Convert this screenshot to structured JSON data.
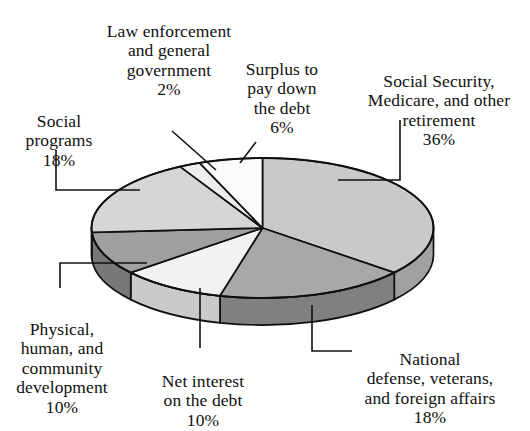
{
  "chart_data": {
    "type": "pie",
    "title": "",
    "subtitle": "",
    "xlabel": "",
    "ylabel": "",
    "legend_position": "callout-labels",
    "grid": false,
    "three_d": true,
    "start_angle_deg": 0,
    "direction": "clockwise",
    "categories": [
      "Social Security, Medicare, and other retirement",
      "National defense, veterans, and foreign affairs",
      "Net interest on the debt",
      "Physical, human, and community development",
      "Social programs",
      "Law enforcement and general government",
      "Surplus to pay down the debt"
    ],
    "values": [
      36,
      18,
      10,
      10,
      18,
      2,
      6
    ],
    "units": "%",
    "colors": [
      "#c9c9c9",
      "#a8a8a8",
      "#f2f2f2",
      "#a0a0a0",
      "#d6d6d6",
      "#ededed",
      "#fbfbfb"
    ],
    "slices": [
      {
        "label": "Social Security,\nMedicare, and other\nretirement",
        "pct": "36%",
        "value": 36,
        "color": "#c9c9c9"
      },
      {
        "label": "National\ndefense, veterans,\nand foreign affairs",
        "pct": "18%",
        "value": 18,
        "color": "#a8a8a8"
      },
      {
        "label": "Net interest\non the debt",
        "pct": "10%",
        "value": 10,
        "color": "#f2f2f2"
      },
      {
        "label": "Physical,\nhuman, and\ncommunity\ndevelopment",
        "pct": "10%",
        "value": 10,
        "color": "#a0a0a0"
      },
      {
        "label": "Social\nprograms",
        "pct": "18%",
        "value": 18,
        "color": "#d6d6d6"
      },
      {
        "label": "Law enforcement\nand general\ngovernment",
        "pct": "2%",
        "value": 2,
        "color": "#ededed"
      },
      {
        "label": "Surplus to\npay down\nthe debt",
        "pct": "6%",
        "value": 6,
        "color": "#fbfbfb"
      }
    ]
  },
  "labels": {
    "law_enforcement": {
      "text": "Law enforcement\nand general\ngovernment",
      "pct": "2%"
    },
    "surplus": {
      "text": "Surplus to\npay down\nthe debt",
      "pct": "6%"
    },
    "social_security": {
      "text": "Social Security,\nMedicare, and other\nretirement",
      "pct": "36%"
    },
    "social_programs": {
      "text": "Social\nprograms",
      "pct": "18%"
    },
    "physical_human": {
      "text": "Physical,\nhuman, and\ncommunity\ndevelopment",
      "pct": "10%"
    },
    "net_interest": {
      "text": "Net interest\non the debt",
      "pct": "10%"
    },
    "national_defense": {
      "text": "National\ndefense, veterans,\nand foreign affairs",
      "pct": "18%"
    }
  }
}
